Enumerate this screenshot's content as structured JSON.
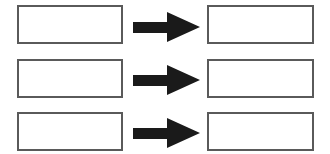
{
  "diagram": {
    "rows": [
      {
        "source": {
          "label": ""
        },
        "target": {
          "label": ""
        },
        "arrow": "right-arrow"
      },
      {
        "source": {
          "label": ""
        },
        "target": {
          "label": ""
        },
        "arrow": "right-arrow"
      },
      {
        "source": {
          "label": ""
        },
        "target": {
          "label": ""
        },
        "arrow": "right-arrow"
      }
    ],
    "colors": {
      "box_border": "#5a5a5a",
      "arrow_fill": "#1a1a1a",
      "background": "#ffffff"
    }
  }
}
